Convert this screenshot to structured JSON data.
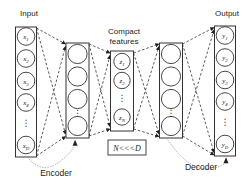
{
  "layers": {
    "input": {
      "label": "Input",
      "nodes": [
        {
          "base": "x",
          "sub": "1"
        },
        {
          "base": "x",
          "sub": "2"
        },
        {
          "base": "x",
          "sub": "3"
        },
        {
          "base": "x",
          "sub": "4"
        },
        {
          "base": "x",
          "sub": "D"
        }
      ]
    },
    "compact": {
      "label_line1": "Compact",
      "label_line2": "features",
      "nodes": [
        {
          "base": "z",
          "sub": "1"
        },
        {
          "base": "z",
          "sub": "2"
        },
        {
          "base": "z",
          "sub": "N"
        }
      ]
    },
    "output": {
      "label": "Output",
      "nodes": [
        {
          "base": "y",
          "sub": "1"
        },
        {
          "base": "y",
          "sub": "2"
        },
        {
          "base": "y",
          "sub": "3"
        },
        {
          "base": "y",
          "sub": "4"
        },
        {
          "base": "y",
          "sub": "D"
        }
      ]
    }
  },
  "annotations": {
    "encoder": "Encoder",
    "decoder": "Decoder",
    "bottleneck_note": "N<<<D",
    "ellipsis": "⋮"
  },
  "colors": {
    "line": "#333333",
    "text": "#222222",
    "background": "#ffffff"
  }
}
